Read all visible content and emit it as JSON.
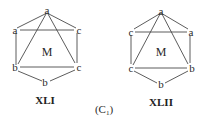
{
  "figure": {
    "caption": "(C",
    "caption_sub": "1",
    "caption_close": ")"
  },
  "structures": [
    {
      "id": "XLI",
      "title": "XLI",
      "center": "M",
      "vertices": {
        "top": "a",
        "upper_left": "a",
        "upper_right": "c",
        "lower_left": "b",
        "lower_right": "c",
        "bottom": "b"
      }
    },
    {
      "id": "XLII",
      "title": "XLII",
      "center": "M",
      "vertices": {
        "top": "a",
        "upper_left": "c",
        "upper_right": "a",
        "lower_left": "c",
        "lower_right": "b",
        "bottom": "b"
      }
    }
  ]
}
